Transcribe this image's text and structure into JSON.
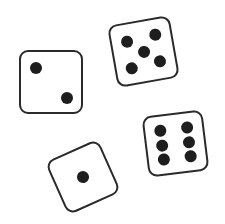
{
  "scene": {
    "description": "Four dice illustration",
    "colors": {
      "background": "#ffffff",
      "outline": "#2a2a2a",
      "pip": "#1e1e1e"
    }
  },
  "dice": [
    {
      "name": "die-two",
      "value": "2",
      "cx": 51,
      "cy": 82,
      "size": 64,
      "rotate": 0,
      "pips": [
        [
          0.25,
          0.27
        ],
        [
          0.76,
          0.76
        ]
      ]
    },
    {
      "name": "die-five",
      "value": "5",
      "cx": 143,
      "cy": 51,
      "size": 63,
      "rotate": -10,
      "pips": [
        [
          0.26,
          0.28
        ],
        [
          0.74,
          0.26
        ],
        [
          0.5,
          0.5
        ],
        [
          0.26,
          0.74
        ],
        [
          0.74,
          0.72
        ]
      ]
    },
    {
      "name": "die-one",
      "value": "1",
      "cx": 83,
      "cy": 177,
      "size": 58,
      "rotate": -24,
      "pips": [
        [
          0.5,
          0.5
        ]
      ]
    },
    {
      "name": "die-six",
      "value": "6",
      "cx": 175,
      "cy": 143,
      "size": 61,
      "rotate": -7,
      "pips": [
        [
          0.27,
          0.24
        ],
        [
          0.27,
          0.5
        ],
        [
          0.27,
          0.76
        ],
        [
          0.73,
          0.24
        ],
        [
          0.73,
          0.5
        ],
        [
          0.73,
          0.76
        ]
      ]
    }
  ]
}
